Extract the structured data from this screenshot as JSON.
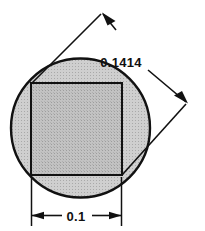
{
  "drawing": {
    "title": "Inscribed square in circle dimension drawing",
    "background_color": "#ffffff",
    "line_color": "#111111",
    "circle": {
      "name": "circle-outline",
      "center_x": 80.5,
      "center_y": 128,
      "radius": 69.5,
      "fill_color": "#c9c9c9",
      "stroke_color": "#111111",
      "stroke_width": 2.2
    },
    "square": {
      "name": "inscribed-square",
      "x": 31,
      "y": 83,
      "width": 91,
      "height": 92,
      "fill_color": "#bdbdbd",
      "stroke_color": "#111111",
      "stroke_width": 2
    },
    "dimensions": [
      {
        "id": "width-dimension",
        "label": "0.1",
        "orientation": "horizontal",
        "label_x": 76,
        "label_y": 221,
        "line_y": 215.5,
        "start_x": 31,
        "end_x": 122,
        "extension_top_y": 177,
        "extension_bottom_y": 226
      },
      {
        "id": "diagonal-dimension",
        "label": "0.1414",
        "orientation": "diagonal",
        "label_x": 120,
        "label_y": 67,
        "arrow_a_x": 103,
        "arrow_a_y": 13,
        "arrow_b_x": 187,
        "arrow_b_y": 102,
        "anchor_a_x": 32,
        "anchor_a_y": 83,
        "anchor_b_x": 122,
        "anchor_b_y": 175
      }
    ]
  }
}
